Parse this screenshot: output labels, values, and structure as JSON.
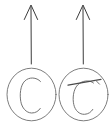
{
  "figure": {
    "background_color": "#ffffff",
    "stroke_color": "#3b3b3b",
    "glyph_color": "#737373",
    "width": 111,
    "height": 125
  },
  "items": [
    {
      "id": "left",
      "arrow": {
        "name": "up-arrow-icon",
        "direction": "up",
        "tip_x": 31,
        "tip_y": 5,
        "tail_x": 31,
        "tail_y": 64,
        "head_half_width": 7,
        "head_height": 14
      },
      "circle": {
        "name": "circle-outline",
        "cx": 31.5,
        "cy": 94.5,
        "rx": 24.5,
        "ry": 26.5
      },
      "glyph": {
        "name": "letter-c-glyph",
        "label": "C",
        "has_overline": false
      }
    },
    {
      "id": "right",
      "arrow": {
        "name": "up-arrow-icon",
        "direction": "up",
        "tip_x": 83,
        "tip_y": 5,
        "tail_x": 83,
        "tail_y": 64,
        "head_half_width": 7,
        "head_height": 14
      },
      "circle": {
        "name": "circle-outline",
        "cx": 83.5,
        "cy": 94.5,
        "rx": 24.5,
        "ry": 26.5
      },
      "glyph": {
        "name": "letter-c-with-overline-glyph",
        "label": "C̅",
        "has_overline": true,
        "overline": {
          "x1": 68,
          "y1": 85,
          "x2": 101,
          "y2": 79.5
        }
      }
    }
  ]
}
